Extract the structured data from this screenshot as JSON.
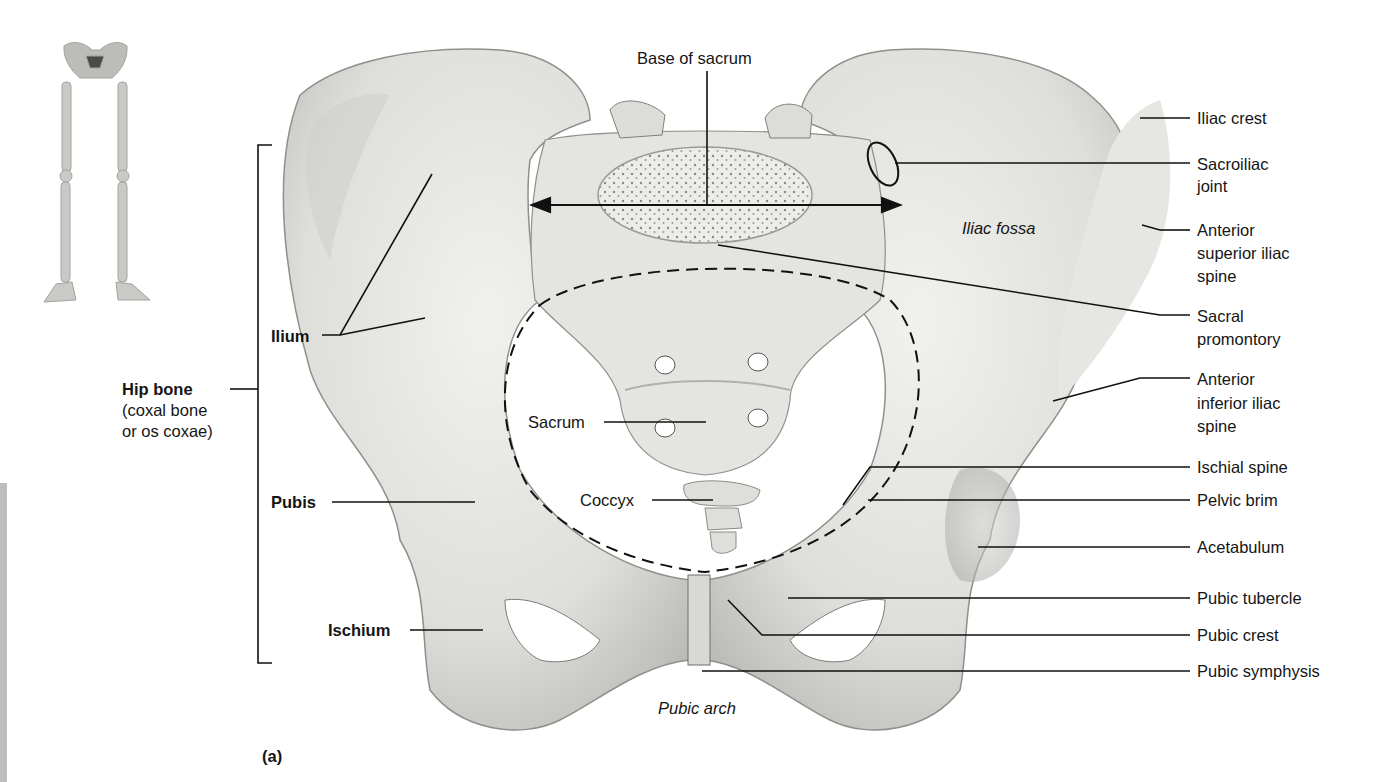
{
  "figure": {
    "panel_label": "(a)",
    "colors": {
      "bone_light": "#e9e9e6",
      "bone_mid": "#d4d4d0",
      "bone_shadow": "#a9a9a5",
      "leader_line": "#111111",
      "background": "#ffffff",
      "left_edge_bar": "#bdbdbd"
    },
    "orientation_icon": "skeleton-lower-limbs-with-pelvis-highlighted"
  },
  "labels_left": {
    "hip_bone_title": "Hip bone",
    "hip_bone_line2": "(coxal bone",
    "hip_bone_line3": "or os coxae)",
    "ilium": "Ilium",
    "pubis": "Pubis",
    "ischium": "Ischium"
  },
  "labels_center": {
    "base_of_sacrum": "Base of sacrum",
    "sacrum": "Sacrum",
    "coccyx": "Coccyx",
    "pubic_arch": "Pubic arch",
    "iliac_fossa": "Iliac fossa"
  },
  "labels_right": [
    {
      "id": "iliac-crest",
      "lines": [
        "Iliac crest"
      ]
    },
    {
      "id": "sacroiliac-joint",
      "lines": [
        "Sacroiliac",
        "joint"
      ]
    },
    {
      "id": "anterior-superior-iliac-spine",
      "lines": [
        "Anterior",
        "superior iliac",
        "spine"
      ]
    },
    {
      "id": "sacral-promontory",
      "lines": [
        "Sacral",
        "promontory"
      ]
    },
    {
      "id": "anterior-inferior-iliac-spine",
      "lines": [
        "Anterior",
        "inferior iliac",
        "spine"
      ]
    },
    {
      "id": "ischial-spine",
      "lines": [
        "Ischial spine"
      ]
    },
    {
      "id": "pelvic-brim",
      "lines": [
        "Pelvic brim"
      ]
    },
    {
      "id": "acetabulum",
      "lines": [
        "Acetabulum"
      ]
    },
    {
      "id": "pubic-tubercle",
      "lines": [
        "Pubic tubercle"
      ]
    },
    {
      "id": "pubic-crest",
      "lines": [
        "Pubic crest"
      ]
    },
    {
      "id": "pubic-symphysis",
      "lines": [
        "Pubic symphysis"
      ]
    }
  ]
}
